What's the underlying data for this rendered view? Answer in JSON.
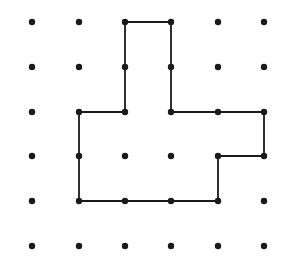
{
  "diagram": {
    "type": "dot-grid-polygon",
    "grid": {
      "columns": 6,
      "rows": 6,
      "x_positions": [
        32,
        79,
        125,
        171,
        218,
        264
      ],
      "y_positions": [
        22,
        67,
        112,
        156,
        201,
        246
      ],
      "dot_radius": 3.2,
      "dot_color": "#1a1a1a"
    },
    "polygon": {
      "stroke_color": "#1a1a1a",
      "stroke_width": 1.8,
      "vertices_grid": [
        [
          2,
          0
        ],
        [
          3,
          0
        ],
        [
          3,
          2
        ],
        [
          5,
          2
        ],
        [
          5,
          3
        ],
        [
          4,
          3
        ],
        [
          4,
          4
        ],
        [
          1,
          4
        ],
        [
          1,
          2
        ],
        [
          2,
          2
        ]
      ]
    }
  }
}
